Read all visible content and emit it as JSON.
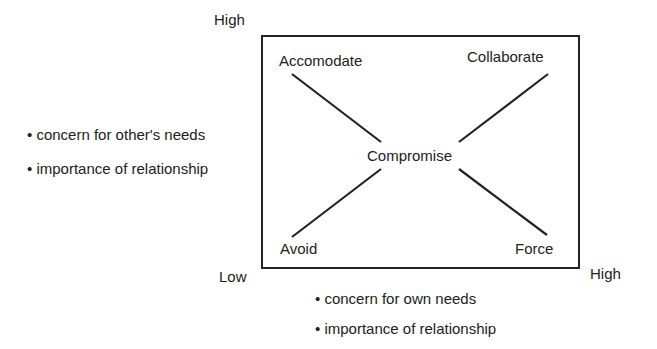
{
  "diagram": {
    "y_axis": {
      "high_label": "High",
      "criteria": [
        "• concern for other's needs",
        "• importance of relationship"
      ]
    },
    "x_axis": {
      "low_label": "Low",
      "high_label": "High",
      "criteria": [
        "• concern for own needs",
        "• importance of relationship"
      ]
    },
    "quadrants": {
      "top_left": "Accomodate",
      "top_right": "Collaborate",
      "bottom_left": "Avoid",
      "bottom_right": "Force",
      "center": "Compromise"
    },
    "colors": {
      "line": "#222222",
      "background": "#ffffff"
    }
  }
}
